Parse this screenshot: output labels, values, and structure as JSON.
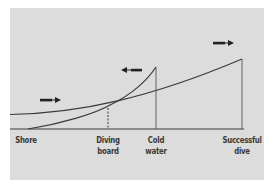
{
  "diagram": {
    "background_color": "#dcdcdc",
    "line_color": "#3a3a3a",
    "labels": [
      {
        "id": "shore",
        "lines": [
          "Shore"
        ]
      },
      {
        "id": "diving-board",
        "lines": [
          "Diving",
          "board"
        ]
      },
      {
        "id": "cold-water",
        "lines": [
          "Cold",
          "water"
        ]
      },
      {
        "id": "successful-dive",
        "lines": [
          "Successful",
          "dive"
        ]
      }
    ],
    "curves": [
      {
        "name": "approach-gradient",
        "description": "gently rising curve from Shore to Successful dive"
      },
      {
        "name": "avoidance-gradient",
        "description": "steeply rising curve peaking at Cold water"
      }
    ],
    "arrows": [
      {
        "name": "arrow-right-approach-low",
        "direction": "right"
      },
      {
        "name": "arrow-left-avoidance",
        "direction": "left"
      },
      {
        "name": "arrow-right-approach-high",
        "direction": "right"
      }
    ],
    "markers": [
      {
        "name": "diving-board-marker",
        "style": "dashed"
      },
      {
        "name": "cold-water-marker",
        "style": "solid"
      },
      {
        "name": "successful-dive-marker",
        "style": "solid"
      }
    ]
  }
}
